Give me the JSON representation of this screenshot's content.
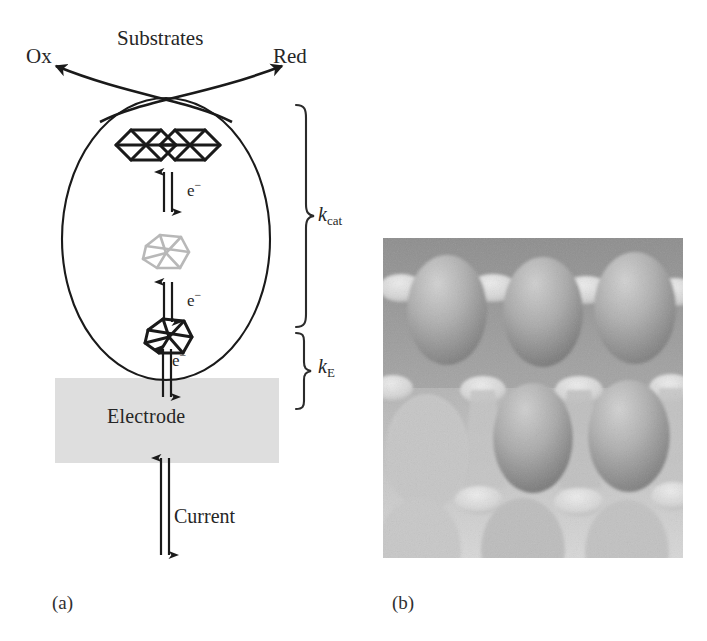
{
  "figure": {
    "panels": [
      {
        "id": "a",
        "label": "(a)",
        "kind": "schematic-diagram"
      },
      {
        "id": "b",
        "label": "(b)",
        "kind": "grayscale-micrograph"
      }
    ]
  },
  "diagram": {
    "title_species": "Substrates",
    "product_left": "Ox",
    "product_right": "Red",
    "electrode_label": "Electrode",
    "current_label": "Current",
    "electron_labels": [
      "e−",
      "e−",
      "e−"
    ],
    "electron_symbol": "e",
    "electron_charge": "−",
    "rate_constants": [
      {
        "symbol": "k",
        "subscript": "cat",
        "name": "k-cat",
        "span": "enzyme-catalysis"
      },
      {
        "symbol": "k",
        "subscript": "E",
        "name": "k-E",
        "span": "electrode-transfer"
      }
    ],
    "clusters": [
      {
        "name": "top-cluster",
        "style": "double-hexagon-wireframe",
        "color": "#1a1a1a"
      },
      {
        "name": "middle-cluster",
        "style": "polyhedron-wireframe",
        "color": "#b8b8b8"
      },
      {
        "name": "bottom-cluster",
        "style": "polyhedron-wireframe",
        "color": "#1a1a1a"
      }
    ],
    "colors": {
      "ink": "#262626",
      "electrode_fill": "#dedede",
      "faded_cluster": "#b8b8b8"
    }
  },
  "photo": {
    "description": "grayscale close-up of rounded egg-like domes arranged in a carton grid",
    "colors": {
      "background": "#9a9a9a",
      "dome_light": "#c9c9c9",
      "dome_mid": "#a8a8a8",
      "dome_dark": "#7e7e7e",
      "peak_highlight": "#e4e4e4"
    }
  }
}
